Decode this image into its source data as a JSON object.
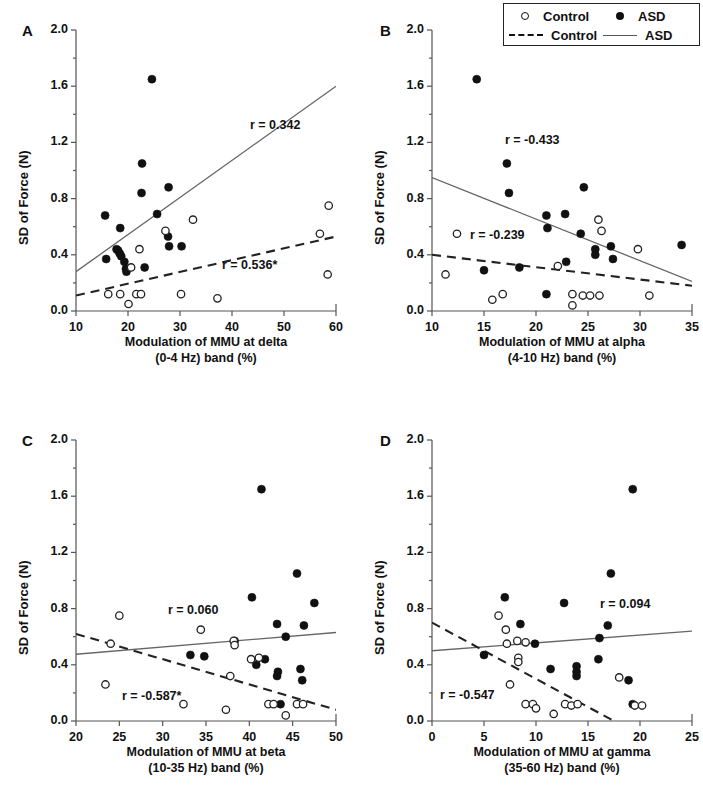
{
  "figure": {
    "legend": {
      "items": [
        {
          "marker": "open-circle-icon",
          "label": "Control"
        },
        {
          "marker": "filled-circle-icon",
          "label": "ASD"
        },
        {
          "marker": "dashed-line-icon",
          "label": "Control"
        },
        {
          "marker": "solid-line-icon",
          "label": "ASD"
        }
      ]
    },
    "shared": {
      "ylabel": "SD of Force (N)",
      "yticks": [
        "0.0",
        "0.4",
        "0.8",
        "1.2",
        "1.6",
        "2.0"
      ],
      "ylim": [
        0.0,
        2.0
      ]
    },
    "panels": [
      {
        "letter": "A",
        "xlabel_line1": "Modulation of MMU at delta",
        "xlabel_line2": "(0-4 Hz) band (%)",
        "xticks": [
          "10",
          "20",
          "30",
          "40",
          "50",
          "60"
        ],
        "annotations": [
          {
            "text": "r = 0.342",
            "group": "ASD"
          },
          {
            "text": "r = 0.536*",
            "group": "Control"
          }
        ]
      },
      {
        "letter": "B",
        "xlabel_line1": "Modulation of MMU at alpha",
        "xlabel_line2": "(4-10 Hz) band (%)",
        "xticks": [
          "10",
          "15",
          "20",
          "25",
          "30",
          "35"
        ],
        "annotations": [
          {
            "text": "r = -0.433",
            "group": "ASD"
          },
          {
            "text": "r = -0.239",
            "group": "Control"
          }
        ]
      },
      {
        "letter": "C",
        "xlabel_line1": "Modulation of MMU at beta",
        "xlabel_line2": "(10-35 Hz) band (%)",
        "xticks": [
          "20",
          "25",
          "30",
          "35",
          "40",
          "45",
          "50"
        ],
        "annotations": [
          {
            "text": "r = 0.060",
            "group": "ASD"
          },
          {
            "text": "r = -0.587*",
            "group": "Control"
          }
        ]
      },
      {
        "letter": "D",
        "xlabel_line1": "Modulation of MMU at gamma",
        "xlabel_line2": "(35-60 Hz) band (%)",
        "xticks": [
          "0",
          "5",
          "10",
          "15",
          "20",
          "25"
        ],
        "annotations": [
          {
            "text": "r = 0.094",
            "group": "ASD"
          },
          {
            "text": "r = -0.547",
            "group": "Control"
          }
        ]
      }
    ]
  },
  "chart_data": [
    {
      "type": "scatter",
      "panel": "A",
      "title": "",
      "xlabel": "Modulation of MMU at delta (0-4 Hz) band (%)",
      "ylabel": "SD of Force (N)",
      "xlim": [
        10,
        60
      ],
      "ylim": [
        0.0,
        2.0
      ],
      "xticks": [
        10,
        20,
        30,
        40,
        50,
        60
      ],
      "yticks": [
        0.0,
        0.4,
        0.8,
        1.2,
        1.6,
        2.0
      ],
      "grid": false,
      "legend_position": "top-right-outside",
      "series": [
        {
          "name": "ASD",
          "marker": "filled-circle",
          "points": [
            [
              24.6,
              1.65
            ],
            [
              22.7,
              1.05
            ],
            [
              22.6,
              0.84
            ],
            [
              27.8,
              0.88
            ],
            [
              15.6,
              0.68
            ],
            [
              18.5,
              0.59
            ],
            [
              25.6,
              0.69
            ],
            [
              27.7,
              0.53
            ],
            [
              27.9,
              0.46
            ],
            [
              30.3,
              0.46
            ],
            [
              15.8,
              0.37
            ],
            [
              17.8,
              0.44
            ],
            [
              18.1,
              0.43
            ],
            [
              18.4,
              0.41
            ],
            [
              18.7,
              0.39
            ],
            [
              19.3,
              0.35
            ],
            [
              19.6,
              0.3
            ],
            [
              19.7,
              0.28
            ],
            [
              23.2,
              0.31
            ]
          ],
          "fit_line": {
            "x": [
              10,
              60
            ],
            "y": [
              0.28,
              1.6
            ],
            "style": "solid"
          },
          "annotation": "r = 0.342"
        },
        {
          "name": "Control",
          "marker": "open-circle",
          "points": [
            [
              58.6,
              0.75
            ],
            [
              32.5,
              0.65
            ],
            [
              56.9,
              0.55
            ],
            [
              27.2,
              0.57
            ],
            [
              22.2,
              0.44
            ],
            [
              58.4,
              0.26
            ],
            [
              20.6,
              0.31
            ],
            [
              16.2,
              0.12
            ],
            [
              18.5,
              0.12
            ],
            [
              21.6,
              0.12
            ],
            [
              22.5,
              0.12
            ],
            [
              30.2,
              0.12
            ],
            [
              37.2,
              0.09
            ],
            [
              20.1,
              0.05
            ]
          ],
          "fit_line": {
            "x": [
              10,
              60
            ],
            "y": [
              0.11,
              0.53
            ],
            "style": "dashed"
          },
          "annotation": "r = 0.536*"
        }
      ]
    },
    {
      "type": "scatter",
      "panel": "B",
      "title": "",
      "xlabel": "Modulation of MMU at alpha (4-10 Hz) band (%)",
      "ylabel": "SD of Force (N)",
      "xlim": [
        10,
        35
      ],
      "ylim": [
        0.0,
        2.0
      ],
      "xticks": [
        10,
        15,
        20,
        25,
        30,
        35
      ],
      "yticks": [
        0.0,
        0.4,
        0.8,
        1.2,
        1.6,
        2.0
      ],
      "grid": false,
      "legend_position": "top-right-outside",
      "series": [
        {
          "name": "ASD",
          "marker": "filled-circle",
          "points": [
            [
              14.3,
              1.65
            ],
            [
              17.2,
              1.05
            ],
            [
              17.4,
              0.84
            ],
            [
              24.6,
              0.88
            ],
            [
              21.0,
              0.68
            ],
            [
              22.8,
              0.69
            ],
            [
              21.1,
              0.59
            ],
            [
              24.3,
              0.55
            ],
            [
              25.7,
              0.44
            ],
            [
              25.7,
              0.4
            ],
            [
              27.2,
              0.46
            ],
            [
              27.4,
              0.37
            ],
            [
              34.0,
              0.47
            ],
            [
              22.9,
              0.35
            ],
            [
              18.4,
              0.31
            ],
            [
              15.0,
              0.29
            ],
            [
              21.0,
              0.12
            ]
          ],
          "fit_line": {
            "x": [
              10,
              35
            ],
            "y": [
              0.95,
              0.21
            ],
            "style": "solid"
          },
          "annotation": "r = -0.433"
        },
        {
          "name": "Control",
          "marker": "open-circle",
          "points": [
            [
              26.0,
              0.65
            ],
            [
              26.3,
              0.57
            ],
            [
              12.4,
              0.55
            ],
            [
              29.8,
              0.44
            ],
            [
              22.1,
              0.32
            ],
            [
              11.3,
              0.26
            ],
            [
              16.8,
              0.12
            ],
            [
              15.8,
              0.08
            ],
            [
              23.5,
              0.12
            ],
            [
              23.5,
              0.04
            ],
            [
              24.5,
              0.11
            ],
            [
              25.2,
              0.11
            ],
            [
              26.1,
              0.11
            ],
            [
              30.9,
              0.11
            ]
          ],
          "fit_line": {
            "x": [
              10,
              35
            ],
            "y": [
              0.4,
              0.18
            ],
            "style": "dashed"
          },
          "annotation": "r = -0.239"
        }
      ]
    },
    {
      "type": "scatter",
      "panel": "C",
      "title": "",
      "xlabel": "Modulation of MMU at beta (10-35 Hz) band (%)",
      "ylabel": "SD of Force (N)",
      "xlim": [
        20,
        50
      ],
      "ylim": [
        0.0,
        2.0
      ],
      "xticks": [
        20,
        25,
        30,
        35,
        40,
        45,
        50
      ],
      "yticks": [
        0.0,
        0.4,
        0.8,
        1.2,
        1.6,
        2.0
      ],
      "grid": false,
      "legend_position": "top-right-outside",
      "series": [
        {
          "name": "ASD",
          "marker": "filled-circle",
          "points": [
            [
              41.4,
              1.65
            ],
            [
              45.5,
              1.05
            ],
            [
              47.5,
              0.84
            ],
            [
              40.3,
              0.88
            ],
            [
              43.2,
              0.69
            ],
            [
              46.3,
              0.68
            ],
            [
              44.2,
              0.6
            ],
            [
              38.3,
              0.57
            ],
            [
              33.2,
              0.47
            ],
            [
              34.8,
              0.46
            ],
            [
              40.8,
              0.4
            ],
            [
              41.8,
              0.44
            ],
            [
              43.3,
              0.35
            ],
            [
              43.2,
              0.32
            ],
            [
              45.9,
              0.37
            ],
            [
              46.1,
              0.29
            ],
            [
              43.6,
              0.12
            ]
          ],
          "fit_line": {
            "x": [
              20,
              50
            ],
            "y": [
              0.475,
              0.63
            ],
            "style": "solid"
          },
          "annotation": "r = 0.060"
        },
        {
          "name": "Control",
          "marker": "open-circle",
          "points": [
            [
              25.0,
              0.75
            ],
            [
              34.4,
              0.65
            ],
            [
              24.0,
              0.55
            ],
            [
              38.2,
              0.57
            ],
            [
              38.3,
              0.54
            ],
            [
              40.2,
              0.44
            ],
            [
              41.1,
              0.45
            ],
            [
              37.8,
              0.32
            ],
            [
              23.4,
              0.26
            ],
            [
              32.4,
              0.12
            ],
            [
              37.3,
              0.08
            ],
            [
              42.2,
              0.12
            ],
            [
              42.8,
              0.12
            ],
            [
              45.5,
              0.12
            ],
            [
              46.2,
              0.12
            ],
            [
              44.2,
              0.04
            ]
          ],
          "fit_line": {
            "x": [
              20,
              50
            ],
            "y": [
              0.62,
              0.08
            ],
            "style": "dashed"
          },
          "annotation": "r = -0.587*"
        }
      ]
    },
    {
      "type": "scatter",
      "panel": "D",
      "title": "",
      "xlabel": "Modulation of MMU at gamma (35-60 Hz) band (%)",
      "ylabel": "SD of Force (N)",
      "xlim": [
        0,
        25
      ],
      "ylim": [
        0.0,
        2.0
      ],
      "xticks": [
        0,
        5,
        10,
        15,
        20,
        25
      ],
      "yticks": [
        0.0,
        0.4,
        0.8,
        1.2,
        1.6,
        2.0
      ],
      "grid": false,
      "legend_position": "top-right-outside",
      "series": [
        {
          "name": "ASD",
          "marker": "filled-circle",
          "points": [
            [
              19.3,
              1.65
            ],
            [
              17.2,
              1.05
            ],
            [
              12.7,
              0.84
            ],
            [
              7.0,
              0.88
            ],
            [
              8.5,
              0.69
            ],
            [
              16.9,
              0.68
            ],
            [
              16.1,
              0.59
            ],
            [
              9.9,
              0.55
            ],
            [
              5.0,
              0.47
            ],
            [
              16.0,
              0.44
            ],
            [
              11.4,
              0.37
            ],
            [
              13.9,
              0.39
            ],
            [
              13.9,
              0.35
            ],
            [
              13.9,
              0.32
            ],
            [
              18.9,
              0.29
            ],
            [
              19.3,
              0.12
            ]
          ],
          "fit_line": {
            "x": [
              0,
              25
            ],
            "y": [
              0.5,
              0.64
            ],
            "style": "solid"
          },
          "annotation": "r = 0.094"
        },
        {
          "name": "Control",
          "marker": "open-circle",
          "points": [
            [
              6.4,
              0.75
            ],
            [
              7.1,
              0.65
            ],
            [
              8.2,
              0.57
            ],
            [
              9.0,
              0.56
            ],
            [
              7.2,
              0.55
            ],
            [
              8.3,
              0.45
            ],
            [
              8.3,
              0.42
            ],
            [
              7.5,
              0.26
            ],
            [
              18.0,
              0.31
            ],
            [
              9.0,
              0.12
            ],
            [
              9.7,
              0.12
            ],
            [
              10.0,
              0.09
            ],
            [
              12.8,
              0.12
            ],
            [
              13.4,
              0.11
            ],
            [
              14.0,
              0.12
            ],
            [
              11.7,
              0.05
            ],
            [
              19.5,
              0.11
            ],
            [
              20.2,
              0.11
            ]
          ],
          "fit_line": {
            "x": [
              0,
              25
            ],
            "y": [
              0.7,
              -0.3
            ],
            "style": "dashed"
          },
          "annotation": "r = -0.547"
        }
      ]
    }
  ]
}
